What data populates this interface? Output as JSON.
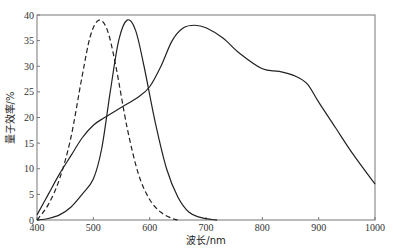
{
  "chart_data": {
    "type": "line",
    "title": "",
    "xlabel": "波长/nm",
    "ylabel": "量子效率/%",
    "xlim": [
      400,
      1000
    ],
    "ylim": [
      0,
      40
    ],
    "xticks": [
      400,
      500,
      600,
      700,
      800,
      900,
      1000
    ],
    "yticks": [
      0,
      5,
      10,
      15,
      20,
      25,
      30,
      35,
      40
    ],
    "grid": false,
    "legend": null,
    "series": [
      {
        "name": "dashed-curve",
        "style": "dashed",
        "x": [
          400,
          420,
          440,
          460,
          480,
          495,
          510,
          525,
          540,
          560,
          580,
          600,
          620,
          640,
          650
        ],
        "y": [
          0,
          3,
          8,
          16,
          28,
          36,
          39,
          37,
          30,
          18,
          9,
          4,
          1.5,
          0.3,
          0
        ]
      },
      {
        "name": "solid-narrow-curve",
        "style": "solid",
        "x": [
          400,
          420,
          440,
          460,
          480,
          500,
          515,
          530,
          545,
          560,
          575,
          590,
          610,
          630,
          650,
          670,
          690,
          710,
          720
        ],
        "y": [
          0,
          0.3,
          1,
          2.5,
          5,
          8,
          14,
          25,
          35,
          39,
          37,
          30,
          19,
          10,
          4.5,
          1.5,
          0.5,
          0.1,
          0
        ]
      },
      {
        "name": "solid-broad-curve",
        "style": "solid",
        "x": [
          400,
          420,
          440,
          460,
          480,
          500,
          520,
          550,
          580,
          600,
          620,
          640,
          660,
          680,
          700,
          730,
          760,
          800,
          830,
          860,
          880,
          900,
          930,
          960,
          1000
        ],
        "y": [
          1,
          5,
          9,
          12.5,
          16,
          18.5,
          20,
          22,
          24,
          26,
          30,
          35,
          37.5,
          38,
          37.5,
          35.5,
          32.5,
          29.5,
          29,
          28,
          26.5,
          23,
          18,
          13,
          7
        ]
      }
    ]
  }
}
